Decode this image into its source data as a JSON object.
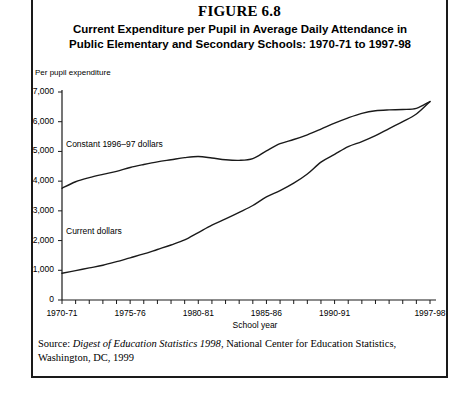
{
  "figure": {
    "number": "FIGURE 6.8",
    "title_line1": "Current Expenditure per Pupil in Average Daily Attendance in",
    "title_line2": "Public Elementary and Secondary Schools: 1970-71 to 1997-98"
  },
  "source": {
    "prefix": "Source: ",
    "publication": "Digest of Education Statistics 1998",
    "rest": ", National Center for Education Statistics,",
    "line2": "Washington, DC, 1999"
  },
  "chart_data": {
    "type": "line",
    "title": "Current Expenditure per Pupil in Average Daily Attendance in Public Elementary and Secondary Schools: 1970-71 to 1997-98",
    "xlabel": "School year",
    "ylabel": "Per pupil expenditure",
    "ylim": [
      0,
      7000
    ],
    "ytick_labels": [
      "7,000",
      "6,000",
      "5,000",
      "4,000",
      "3,000",
      "2,000",
      "1,000",
      "0"
    ],
    "ytick_values": [
      7000,
      6000,
      5000,
      4000,
      3000,
      2000,
      1000,
      0
    ],
    "grid": false,
    "legend": "inline-labels",
    "x": [
      "1970-71",
      "1971-72",
      "1972-73",
      "1973-74",
      "1974-75",
      "1975-76",
      "1976-77",
      "1977-78",
      "1978-79",
      "1979-80",
      "1980-81",
      "1981-82",
      "1982-83",
      "1983-84",
      "1984-85",
      "1985-86",
      "1986-87",
      "1987-88",
      "1988-89",
      "1989-90",
      "1990-91",
      "1991-92",
      "1992-93",
      "1993-94",
      "1994-95",
      "1995-96",
      "1996-97",
      "1997-98"
    ],
    "xtick_labels": [
      "1970-71",
      "1975-76",
      "1980-81",
      "1985-86",
      "1990-91",
      "1997-98"
    ],
    "xtick_label_indices": [
      0,
      5,
      10,
      15,
      20,
      27
    ],
    "series": [
      {
        "name": "Constant 1996-97 dollars",
        "label": "Constant 1996–97 dollars",
        "values": [
          3760,
          3980,
          4120,
          4230,
          4330,
          4460,
          4560,
          4650,
          4720,
          4790,
          4830,
          4780,
          4720,
          4700,
          4760,
          5020,
          5260,
          5400,
          5560,
          5750,
          5950,
          6130,
          6280,
          6370,
          6400,
          6410,
          6450,
          6680
        ]
      },
      {
        "name": "Current dollars",
        "label": "Current dollars",
        "values": [
          900,
          990,
          1080,
          1170,
          1290,
          1420,
          1550,
          1700,
          1850,
          2020,
          2270,
          2520,
          2730,
          2950,
          3180,
          3470,
          3680,
          3930,
          4240,
          4640,
          4900,
          5160,
          5330,
          5530,
          5770,
          6000,
          6260,
          6680
        ]
      }
    ]
  }
}
